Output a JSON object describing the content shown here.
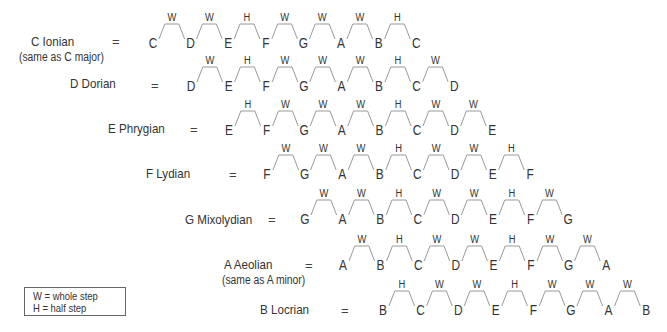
{
  "colors": {
    "text": "#333333",
    "line": "#999999",
    "legend_border": "#666666"
  },
  "modes": [
    {
      "name": "C Ionian",
      "subtitle": "(same as C major)",
      "notes": [
        "C",
        "D",
        "E",
        "F",
        "G",
        "A",
        "B",
        "C"
      ],
      "steps": [
        "W",
        "W",
        "H",
        "W",
        "W",
        "W",
        "H"
      ]
    },
    {
      "name": "D Dorian",
      "subtitle": "",
      "notes": [
        "D",
        "E",
        "F",
        "G",
        "A",
        "B",
        "C",
        "D"
      ],
      "steps": [
        "W",
        "H",
        "W",
        "W",
        "W",
        "H",
        "W"
      ]
    },
    {
      "name": "E Phrygian",
      "subtitle": "",
      "notes": [
        "E",
        "F",
        "G",
        "A",
        "B",
        "C",
        "D",
        "E"
      ],
      "steps": [
        "H",
        "W",
        "W",
        "W",
        "H",
        "W",
        "W"
      ]
    },
    {
      "name": "F Lydian",
      "subtitle": "",
      "notes": [
        "F",
        "G",
        "A",
        "B",
        "C",
        "D",
        "E",
        "F"
      ],
      "steps": [
        "W",
        "W",
        "W",
        "H",
        "W",
        "W",
        "H"
      ]
    },
    {
      "name": "G Mixolydian",
      "subtitle": "",
      "notes": [
        "G",
        "A",
        "B",
        "C",
        "D",
        "E",
        "F",
        "G"
      ],
      "steps": [
        "W",
        "W",
        "H",
        "W",
        "W",
        "H",
        "W"
      ]
    },
    {
      "name": "A Aeolian",
      "subtitle": "(same as A minor)",
      "notes": [
        "A",
        "B",
        "C",
        "D",
        "E",
        "F",
        "G",
        "A"
      ],
      "steps": [
        "W",
        "H",
        "W",
        "W",
        "H",
        "W",
        "W"
      ]
    },
    {
      "name": "B Locrian",
      "subtitle": "",
      "notes": [
        "B",
        "C",
        "D",
        "E",
        "F",
        "G",
        "A",
        "B"
      ],
      "steps": [
        "H",
        "W",
        "W",
        "H",
        "W",
        "W",
        "W"
      ]
    }
  ],
  "equals": "=",
  "legend": {
    "line1": "W = whole step",
    "line2": "H = half step"
  }
}
